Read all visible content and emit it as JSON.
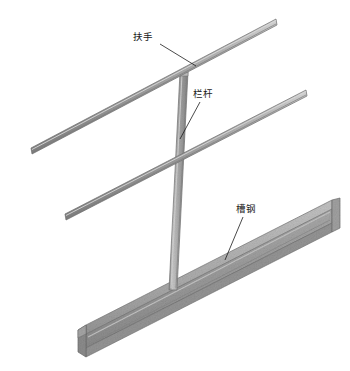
{
  "figure": {
    "title": "",
    "background_color": "#ffffff",
    "width": 350,
    "height": 371
  },
  "labels": [
    {
      "id": "handrail",
      "text": "扶手",
      "text_x": 143,
      "text_y": 40,
      "leader_from_x": 160,
      "leader_from_y": 44,
      "leader_to_x": 196,
      "leader_to_y": 66
    },
    {
      "id": "baluster",
      "text": "栏杆",
      "text_x": 193,
      "text_y": 97,
      "leader_from_x": 200,
      "leader_from_y": 102,
      "leader_to_x": 180,
      "leader_to_y": 139
    },
    {
      "id": "channel-steel",
      "text": "槽钢",
      "text_x": 235,
      "text_y": 212,
      "leader_from_x": 243,
      "leader_from_y": 217,
      "leader_to_x": 225,
      "leader_to_y": 260
    }
  ],
  "parts": {
    "upper_rail": {
      "name": "扶手",
      "role": "upper-handrail-bar",
      "x1": 31,
      "y1": 151,
      "x2": 276,
      "y2": 22,
      "thickness": 6,
      "color": "#9b9b9b",
      "highlight_color": "#cfcfcf",
      "shadow_color": "#7a7a7a"
    },
    "middle_rail": {
      "name": "扶手",
      "role": "middle-handrail-bar",
      "x1": 65,
      "y1": 217,
      "x2": 306,
      "y2": 93,
      "thickness": 6,
      "color": "#9b9b9b",
      "highlight_color": "#cfcfcf",
      "shadow_color": "#7a7a7a"
    },
    "post": {
      "name": "栏杆",
      "role": "vertical-baluster-post",
      "x1": 184,
      "y1": 73,
      "x2": 172,
      "y2": 288,
      "thickness": 8,
      "color": "#a2a2a2",
      "highlight_color": "#d2d2d2",
      "shadow_color": "#7d7d7d"
    },
    "channel": {
      "name": "槽钢",
      "role": "channel-steel-beam",
      "x1": 86,
      "y1": 332,
      "x2": 332,
      "y2": 207,
      "web_height": 34,
      "flange_height": 9,
      "color": "#9d9d9d",
      "flange_color": "#b4b4b4",
      "edge_color": "#777777",
      "end_cap_color": "#8e8e8e"
    }
  },
  "colors": {
    "background": "#ffffff",
    "metal_base": "#9b9b9b",
    "metal_light": "#cfcfcf",
    "metal_dark": "#787878",
    "ink": "#1a1a1a"
  }
}
